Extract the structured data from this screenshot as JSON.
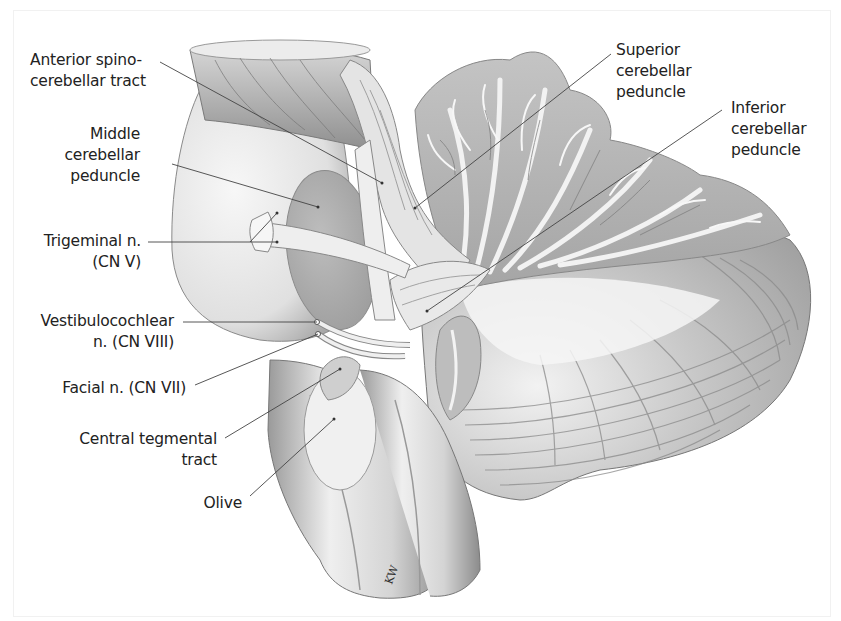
{
  "figure": {
    "type": "anatomical illustration",
    "signature": "KW",
    "colors": {
      "background": "#ffffff",
      "label_text": "#222222",
      "leader_line": "#444444",
      "tissue_light": "#e6e6e6",
      "tissue_mid": "#b9b9b9",
      "tissue_dark": "#8a8a8a"
    }
  },
  "labels": {
    "anterior_spinocerebellar": {
      "line1": "Anterior spino-",
      "line2": "cerebellar tract"
    },
    "middle_cerebellar": {
      "line1": "Middle",
      "line2": "cerebellar",
      "line3": "peduncle"
    },
    "trigeminal": {
      "line1": "Trigeminal n.",
      "line2": "(CN V)"
    },
    "vestibulocochlear": {
      "line1": "Vestibulocochlear",
      "line2": "n. (CN VIII)"
    },
    "facial": {
      "line1": "Facial n. (CN VII)"
    },
    "central_tegmental": {
      "line1": "Central tegmental",
      "line2": "tract"
    },
    "olive": {
      "line1": "Olive"
    },
    "superior_cerebellar": {
      "line1": "Superior",
      "line2": "cerebellar",
      "line3": "peduncle"
    },
    "inferior_cerebellar": {
      "line1": "Inferior",
      "line2": "cerebellar",
      "line3": "peduncle"
    }
  }
}
